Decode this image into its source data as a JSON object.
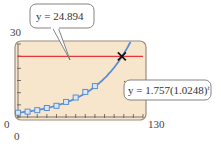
{
  "chart_data": {
    "type": "line",
    "title": "",
    "xlabel": "",
    "ylabel": "",
    "xlim": [
      0,
      130
    ],
    "ylim": [
      0,
      30
    ],
    "x_ticks": {
      "min": 0,
      "max": 130,
      "step": 10
    },
    "y_ticks": {
      "min": 0,
      "max": 30,
      "step": 5
    },
    "tick_labels": {
      "x_min": "0",
      "x_max": "130",
      "y_min": "0",
      "y_max": "30"
    },
    "grid": false,
    "background": "#f8e6cc",
    "series": [
      {
        "name": "data points",
        "type": "scatter",
        "marker": "square",
        "color": "#5a8fd0",
        "x": [
          0,
          10,
          20,
          30,
          40,
          50,
          60,
          70,
          80
        ],
        "y": [
          1.76,
          2.2,
          2.8,
          3.7,
          4.6,
          6.2,
          8.0,
          10.3,
          12.7
        ]
      },
      {
        "name": "exponential model",
        "type": "line",
        "color": "#5a8fd0",
        "equation": "y = 1.757(1.0248)^t",
        "a": 1.757,
        "b": 1.0248
      },
      {
        "name": "horizontal line",
        "type": "line",
        "color": "#e8343a",
        "equation": "y = 24.894",
        "y_value": 24.894
      }
    ],
    "annotations": [
      {
        "text": "y = 24.894",
        "target": "horizontal line"
      },
      {
        "text": "y = 1.757(1.0248)",
        "superscript": "t",
        "target": "exponential model"
      },
      {
        "type": "intersection-marker",
        "marker": "x",
        "x": 108,
        "y": 24.894
      }
    ]
  },
  "labels": {
    "y_max": "30",
    "y_min": "0",
    "x_min": "0",
    "x_max": "130",
    "callout_line": "y = 24.894",
    "callout_curve_main": "y = 1.757(1.0248)",
    "callout_curve_sup": "t"
  }
}
